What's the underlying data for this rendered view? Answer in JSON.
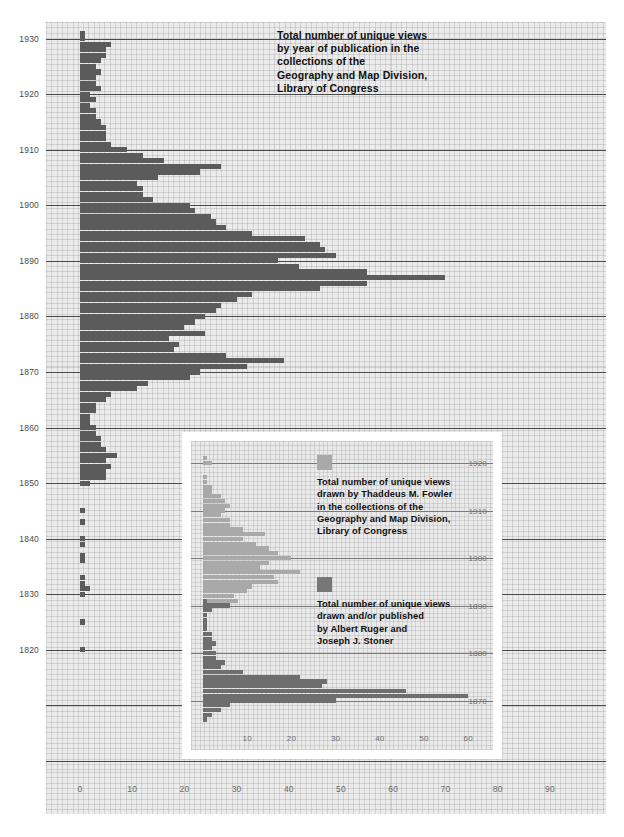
{
  "main": {
    "title_lines": [
      "Total number of unique views",
      "by year of publication in the",
      "collections of the",
      "Geography and Map Division,",
      "Library of Congress"
    ],
    "bar_color": "#5b5b5b",
    "plot_bg": "#ebebeb"
  },
  "inset": {
    "frame_color": "#ffffff",
    "plot_bg": "#e9e9e9",
    "legend": [
      {
        "swatch": "fowler",
        "color": "#a9a9a9",
        "lines": [
          "Total number of unique views",
          "drawn by Thaddeus M. Fowler",
          "in the collections of the",
          "Geography and Map Division,",
          "Library of Congress"
        ]
      },
      {
        "swatch": "ruger",
        "color": "#777777",
        "lines": [
          "Total number of unique views",
          "drawn and/or published",
          "by Albert Ruger and",
          "Joseph J. Stoner"
        ]
      }
    ]
  },
  "chart_data": [
    {
      "id": "main",
      "type": "bar",
      "orientation": "horizontal",
      "title": "Total number of unique views by year of publication in the collections of the Geography and Map Division, Library of Congress",
      "xlabel": "",
      "ylabel": "",
      "xlim": [
        0,
        95
      ],
      "ylim": [
        1798,
        1933
      ],
      "xticks": [
        0,
        10,
        20,
        30,
        40,
        50,
        60,
        70,
        80,
        90
      ],
      "yticks": [
        1930,
        1920,
        1910,
        1900,
        1890,
        1880,
        1870,
        1860,
        1850,
        1840,
        1830,
        1820
      ],
      "grid": true,
      "legend": "none",
      "series_name": "Unique views by year of publication",
      "x": [
        1800,
        1801,
        1802,
        1803,
        1804,
        1805,
        1806,
        1807,
        1808,
        1809,
        1810,
        1811,
        1812,
        1813,
        1814,
        1815,
        1816,
        1817,
        1818,
        1819,
        1820,
        1821,
        1822,
        1823,
        1824,
        1825,
        1826,
        1827,
        1828,
        1829,
        1830,
        1831,
        1832,
        1833,
        1834,
        1835,
        1836,
        1837,
        1838,
        1839,
        1840,
        1841,
        1842,
        1843,
        1844,
        1845,
        1846,
        1847,
        1848,
        1849,
        1850,
        1851,
        1852,
        1853,
        1854,
        1855,
        1856,
        1857,
        1858,
        1859,
        1860,
        1861,
        1862,
        1863,
        1864,
        1865,
        1866,
        1867,
        1868,
        1869,
        1870,
        1871,
        1872,
        1873,
        1874,
        1875,
        1876,
        1877,
        1878,
        1879,
        1880,
        1881,
        1882,
        1883,
        1884,
        1885,
        1886,
        1887,
        1888,
        1889,
        1890,
        1891,
        1892,
        1893,
        1894,
        1895,
        1896,
        1897,
        1898,
        1899,
        1900,
        1901,
        1902,
        1903,
        1904,
        1905,
        1906,
        1907,
        1908,
        1909,
        1910,
        1911,
        1912,
        1913,
        1914,
        1915,
        1916,
        1917,
        1918,
        1919,
        1920,
        1921,
        1922,
        1923,
        1924,
        1925,
        1926,
        1927,
        1928,
        1929,
        1930,
        1931
      ],
      "values": [
        0,
        0,
        0,
        0,
        0,
        0,
        0,
        0,
        0,
        0,
        0,
        0,
        0,
        0,
        0,
        0,
        0,
        0,
        0,
        0,
        1,
        0,
        0,
        0,
        0,
        1,
        0,
        0,
        0,
        0,
        1,
        2,
        1,
        1,
        0,
        0,
        1,
        1,
        0,
        1,
        1,
        0,
        0,
        1,
        0,
        1,
        0,
        0,
        0,
        0,
        2,
        5,
        5,
        6,
        5,
        7,
        5,
        4,
        4,
        3,
        3,
        2,
        2,
        3,
        3,
        5,
        6,
        11,
        13,
        21,
        23,
        32,
        39,
        28,
        18,
        19,
        17,
        24,
        20,
        22,
        24,
        26,
        27,
        30,
        33,
        46,
        55,
        70,
        55,
        42,
        38,
        49,
        47,
        46,
        43,
        33,
        28,
        26,
        25,
        22,
        21,
        14,
        12,
        12,
        11,
        15,
        23,
        27,
        16,
        12,
        9,
        6,
        5,
        5,
        5,
        4,
        3,
        3,
        2,
        3,
        2,
        4,
        3,
        3,
        4,
        3,
        4,
        5,
        5,
        6,
        1,
        1
      ]
    },
    {
      "id": "inset",
      "type": "bar",
      "orientation": "horizontal",
      "title": "Unique views by Thaddeus M. Fowler and by Albert Ruger / Joseph J. Stoner",
      "xlim": [
        0,
        66
      ],
      "ylim": [
        1864,
        1924
      ],
      "xticks": [
        10,
        20,
        30,
        40,
        50,
        60
      ],
      "yticks": [
        1920,
        1910,
        1900,
        1890,
        1880,
        1870
      ],
      "grid": true,
      "legend": "inside-right",
      "series": [
        {
          "name": "Total number of unique views drawn by Thaddeus M. Fowler in the collections of the Geography and Map Division, Library of Congress",
          "color": "#a9a9a9",
          "x": [
            1870,
            1871,
            1872,
            1873,
            1874,
            1875,
            1876,
            1877,
            1878,
            1879,
            1880,
            1881,
            1882,
            1883,
            1884,
            1885,
            1886,
            1887,
            1888,
            1889,
            1890,
            1891,
            1892,
            1893,
            1894,
            1895,
            1896,
            1897,
            1898,
            1899,
            1900,
            1901,
            1902,
            1903,
            1904,
            1905,
            1906,
            1907,
            1908,
            1909,
            1910,
            1911,
            1912,
            1913,
            1914,
            1915,
            1916,
            1917,
            1918,
            1919,
            1920,
            1921,
            1922
          ],
          "values": [
            0,
            0,
            0,
            0,
            0,
            0,
            0,
            0,
            0,
            0,
            0,
            0,
            0,
            0,
            0,
            0,
            0,
            0,
            0,
            0,
            2,
            8,
            7,
            10,
            11,
            17,
            16,
            22,
            13,
            15,
            20,
            17,
            15,
            12,
            9,
            14,
            9,
            6,
            6,
            4,
            5,
            6,
            5,
            4,
            2,
            2,
            1,
            1,
            0,
            0,
            2,
            1,
            0
          ]
        },
        {
          "name": "Total number of unique views drawn and/or published by Albert Ruger and Joseph J. Stoner",
          "color": "#6e6e6e",
          "x": [
            1866,
            1867,
            1868,
            1869,
            1870,
            1871,
            1872,
            1873,
            1874,
            1875,
            1876,
            1877,
            1878,
            1879,
            1880,
            1881,
            1882,
            1883,
            1884,
            1885,
            1886,
            1887,
            1888,
            1889,
            1890,
            1891,
            1892
          ],
          "values": [
            1,
            2,
            4,
            6,
            30,
            60,
            46,
            27,
            28,
            22,
            9,
            4,
            5,
            3,
            3,
            2,
            3,
            2,
            2,
            1,
            1,
            1,
            1,
            2,
            6,
            1,
            0
          ]
        }
      ]
    }
  ]
}
